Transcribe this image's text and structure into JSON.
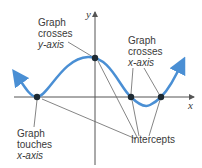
{
  "figure": {
    "axes": {
      "x_label": "x",
      "y_label": "y"
    },
    "annotations": {
      "y_cross": [
        "Graph",
        "crosses",
        "y-axis"
      ],
      "x_cross": [
        "Graph",
        "crosses",
        "x-axis"
      ],
      "x_touch": [
        "Graph",
        "touches",
        "x-axis"
      ],
      "intercepts": "Intercepts"
    },
    "points": [
      {
        "name": "touch-x-axis",
        "x": 37,
        "y": 97
      },
      {
        "name": "y-intercept",
        "x": 95,
        "y": 58
      },
      {
        "name": "x-intercept-1",
        "x": 131,
        "y": 97
      },
      {
        "name": "x-intercept-2",
        "x": 161,
        "y": 97
      }
    ],
    "colors": {
      "curve": "#4a8fd4",
      "axis": "#555555",
      "point": "#1d2a33",
      "leader": "#666666"
    }
  }
}
